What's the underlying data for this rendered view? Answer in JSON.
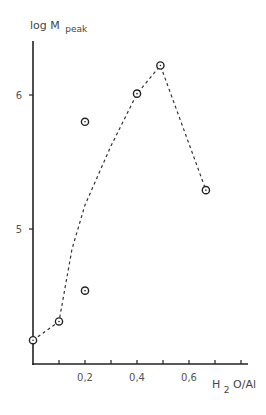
{
  "chart_data": {
    "type": "scatter",
    "title": "",
    "xlabel": "H2O/Al",
    "xlabel_main": "H",
    "xlabel_sub": "2",
    "xlabel_rest": "O/Al",
    "ylabel": "log M peak",
    "ylabel_main": "log M",
    "ylabel_sub": "peak",
    "xlim": [
      0,
      0.83
    ],
    "ylim": [
      4.0,
      6.4
    ],
    "grid": false,
    "legend": null,
    "x_ticks": [
      0.1,
      0.2,
      0.3,
      0.4,
      0.5,
      0.6,
      0.7,
      0.8
    ],
    "x_tick_labels": [
      {
        "value": 0.2,
        "label": "0,2"
      },
      {
        "value": 0.4,
        "label": "0,4"
      },
      {
        "value": 0.6,
        "label": "0,6"
      }
    ],
    "y_ticks": [
      {
        "value": 6,
        "label": "6"
      },
      {
        "value": 5,
        "label": "5"
      }
    ],
    "series": [
      {
        "name": "measured",
        "marker": "circle-dot",
        "points": [
          {
            "x": 0.0,
            "y": 4.17
          },
          {
            "x": 0.1,
            "y": 4.31
          },
          {
            "x": 0.2,
            "y": 5.8
          },
          {
            "x": 0.2,
            "y": 4.54
          },
          {
            "x": 0.4,
            "y": 6.01
          },
          {
            "x": 0.49,
            "y": 6.22
          },
          {
            "x": 0.665,
            "y": 5.29
          }
        ]
      },
      {
        "name": "trend",
        "style": "dashed",
        "points": [
          {
            "x": 0.0,
            "y": 4.17
          },
          {
            "x": 0.1,
            "y": 4.31
          },
          {
            "x": 0.15,
            "y": 4.85
          },
          {
            "x": 0.2,
            "y": 5.18
          },
          {
            "x": 0.3,
            "y": 5.62
          },
          {
            "x": 0.4,
            "y": 6.01
          },
          {
            "x": 0.49,
            "y": 6.22
          },
          {
            "x": 0.665,
            "y": 5.29
          }
        ]
      }
    ]
  }
}
